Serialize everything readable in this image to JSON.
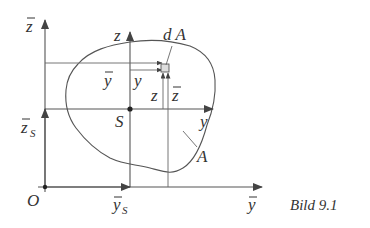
{
  "figure": {
    "caption": "Bild 9.1"
  },
  "labels": {
    "zbar_axis": "z",
    "z_axis": "z",
    "dA": "d A",
    "ybar_inner": "y",
    "y_inner": "y",
    "z_inner": "z",
    "zbar_inner": "z",
    "S_point": "S",
    "zS": "z",
    "zS_sub": "S",
    "y_axis": "y",
    "A_area": "A",
    "O_origin": "O",
    "yS": "y",
    "yS_sub": "S",
    "ybar_axis": "y"
  },
  "points": {
    "O": {
      "x": 45,
      "y": 187
    },
    "S": {
      "x": 130,
      "y": 109
    },
    "dA": {
      "x": 164,
      "y": 68
    }
  },
  "colors": {
    "line": "#555555",
    "text": "#333333",
    "background": "#ffffff"
  }
}
